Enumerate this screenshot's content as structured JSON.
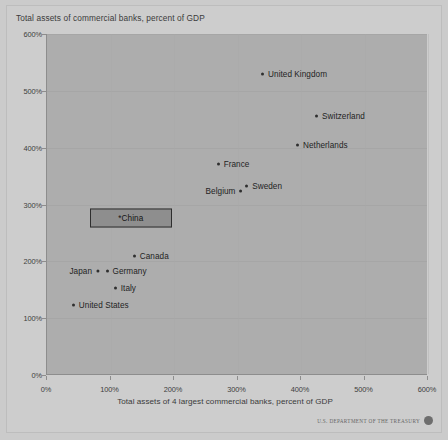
{
  "chart_data": {
    "type": "scatter",
    "title": "Total assets of commercial banks, percent of GDP",
    "xlabel": "Total assets of 4 largest commercial banks, percent of GDP",
    "ylabel": "Total assets of commercial banks, percent of GDP",
    "xlim": [
      0,
      600
    ],
    "ylim": [
      0,
      600
    ],
    "xticks": [
      "0%",
      "100%",
      "200%",
      "300%",
      "400%",
      "500%",
      "600%"
    ],
    "yticks": [
      "0%",
      "100%",
      "200%",
      "300%",
      "400%",
      "500%",
      "600%"
    ],
    "xtick_values": [
      0,
      100,
      200,
      300,
      400,
      500,
      600
    ],
    "ytick_values": [
      0,
      100,
      200,
      300,
      400,
      500,
      600
    ],
    "grid": true,
    "legend": "none",
    "points": [
      {
        "label": "United Kingdom",
        "x": 345,
        "y": 530,
        "label_side": "right",
        "highlighted": false
      },
      {
        "label": "Switzerland",
        "x": 430,
        "y": 455,
        "label_side": "right",
        "highlighted": false
      },
      {
        "label": "Netherlands",
        "x": 400,
        "y": 405,
        "label_side": "right",
        "highlighted": false
      },
      {
        "label": "France",
        "x": 275,
        "y": 372,
        "label_side": "right",
        "highlighted": false
      },
      {
        "label": "Sweden",
        "x": 320,
        "y": 332,
        "label_side": "right",
        "highlighted": false
      },
      {
        "label": "Belgium",
        "x": 300,
        "y": 324,
        "label_side": "left",
        "highlighted": false
      },
      {
        "label": "*China",
        "x": 132,
        "y": 277,
        "label_side": "box",
        "highlighted": true
      },
      {
        "label": "Canada",
        "x": 143,
        "y": 210,
        "label_side": "right",
        "highlighted": false
      },
      {
        "label": "Germany",
        "x": 100,
        "y": 183,
        "label_side": "right",
        "highlighted": false
      },
      {
        "label": "Japan",
        "x": 74,
        "y": 183,
        "label_side": "left",
        "highlighted": false
      },
      {
        "label": "Italy",
        "x": 113,
        "y": 153,
        "label_side": "right",
        "highlighted": false
      },
      {
        "label": "United States",
        "x": 47,
        "y": 123,
        "label_side": "right",
        "highlighted": false
      }
    ]
  },
  "footer": {
    "attribution": "U.S. DEPARTMENT OF THE TREASURY"
  },
  "colors": {
    "page_background": "#cbcbcb",
    "plot_background": "#adadad",
    "marker": "#2f2f2f",
    "highlight_fill": "#8e8e8e",
    "highlight_border": "#2e2e2e",
    "text": "#1f1f1f"
  }
}
